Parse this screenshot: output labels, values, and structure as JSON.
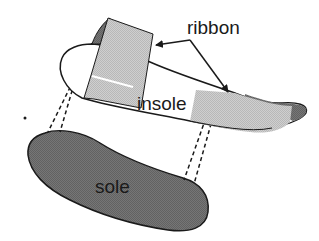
{
  "diagram": {
    "labels": {
      "ribbon": "ribbon",
      "insole": "insole",
      "sole": "sole"
    },
    "components": [
      {
        "name": "ribbon",
        "description": "Two light-gray straps wrapping over the insole (toe-side and heel-side)"
      },
      {
        "name": "insole",
        "description": "White foot-shaped upper piece outlined in black"
      },
      {
        "name": "sole",
        "description": "Dark-gray foot-shaped bottom piece"
      }
    ],
    "connectors": {
      "style": "dashed",
      "count": 4,
      "meaning": "projection lines linking insole ribbon positions to sole"
    },
    "arrows": {
      "count": 2,
      "from": "ribbon",
      "targets": [
        "ribbon-left-strap",
        "ribbon-right-strap"
      ]
    },
    "colors": {
      "ribbon_fill": "#c8c8c8",
      "sole_fill": "#6e6e6e",
      "dark_edge_fill": "#6a6a6a",
      "outline": "#1a1a1a",
      "background": "#ffffff"
    }
  }
}
